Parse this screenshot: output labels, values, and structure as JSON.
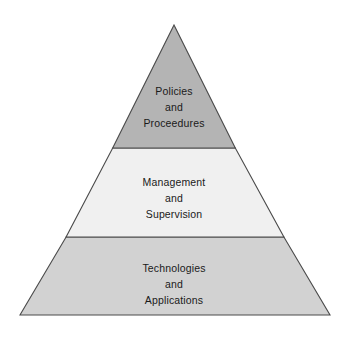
{
  "diagram": {
    "type": "pyramid",
    "orientation": "apex-up",
    "background_color": "#ffffff",
    "outline_color": "#4a4a4a",
    "text_color": "#1a1a1a",
    "geometry": {
      "apex": [
        174,
        25
      ],
      "base_left": [
        20,
        315
      ],
      "base_right": [
        330,
        315
      ],
      "divider_upper_y": 148,
      "divider_lower_y": 237
    },
    "tiers": [
      {
        "id": "top",
        "position": 1,
        "fill_color": "#b4b4b4",
        "lines": [
          "Policies",
          "and",
          "Proceedures"
        ],
        "text_lines": {
          "line1": "Policies",
          "line2": "and",
          "line3": "Proceedures"
        }
      },
      {
        "id": "middle",
        "position": 2,
        "fill_color": "#f0f0f0",
        "lines": [
          "Management",
          "and",
          "Supervision"
        ],
        "text_lines": {
          "line1": "Management",
          "line2": "and",
          "line3": "Supervision"
        }
      },
      {
        "id": "bottom",
        "position": 3,
        "fill_color": "#d2d2d2",
        "lines": [
          "Technologies",
          "and",
          "Applications"
        ],
        "text_lines": {
          "line1": "Technologies",
          "line2": "and",
          "line3": "Applications"
        }
      }
    ]
  }
}
